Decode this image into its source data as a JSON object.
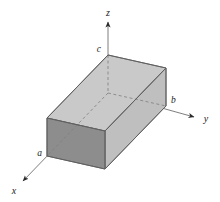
{
  "figure": {
    "kind": "3d-rectangular-box-diagram",
    "background_color": "#ffffff",
    "canvas": {
      "width": 220,
      "height": 202
    }
  },
  "axes": {
    "line_color": "#5a5a5a",
    "arrow_color": "#2b2b2b",
    "origin": {
      "x": 108,
      "y": 93
    },
    "items": [
      {
        "name": "z-axis",
        "label": "z",
        "label_x": 108,
        "label_y": 16,
        "line": {
          "x1": 108,
          "y1": 93,
          "x2": 108,
          "y2": 22
        },
        "arrow_at": {
          "x": 108,
          "y": 22
        },
        "direction": "up"
      },
      {
        "name": "y-axis",
        "label": "y",
        "label_x": 206,
        "label_y": 122,
        "line": {
          "x1": 108,
          "y1": 93,
          "x2": 194,
          "y2": 117
        },
        "arrow_at": {
          "x": 194,
          "y": 117
        },
        "direction": "right-down"
      },
      {
        "name": "x-axis",
        "label": "x",
        "label_x": 14,
        "label_y": 194,
        "line": {
          "x1": 108,
          "y1": 93,
          "x2": 23,
          "y2": 181
        },
        "arrow_at": {
          "x": 23,
          "y": 181
        },
        "direction": "left-down"
      }
    ]
  },
  "box": {
    "name": "rectangular-parallelepiped",
    "edge_color": "#6b6b6b",
    "hidden_edge_color": "#7d7d7d",
    "hidden_edge_dash": "3,2.5",
    "faces": {
      "top": {
        "fill": "#c9c9c9",
        "label": "top-face"
      },
      "front_left": {
        "fill": "#8d8d8d",
        "label": "front-left-face"
      },
      "front_right": {
        "fill": "#bfbfbf",
        "label": "front-right-face"
      }
    },
    "vertices": {
      "origin": {
        "x": 108,
        "y": 93
      },
      "x_base": {
        "x": 47,
        "y": 156
      },
      "y_base": {
        "x": 166,
        "y": 106
      },
      "xy_base": {
        "x": 105,
        "y": 169
      },
      "z_top": {
        "x": 108,
        "y": 55
      },
      "xz_top": {
        "x": 47,
        "y": 118
      },
      "yz_top": {
        "x": 166,
        "y": 68
      },
      "xyz_top": {
        "x": 105,
        "y": 131
      }
    }
  },
  "vertex_labels": [
    {
      "name": "vertex-label-a",
      "text": "a",
      "x": 42,
      "y": 156,
      "anchor": "end",
      "axis": "x"
    },
    {
      "name": "vertex-label-b",
      "text": "b",
      "x": 171,
      "y": 103,
      "anchor": "start",
      "axis": "y"
    },
    {
      "name": "vertex-label-c",
      "text": "c",
      "x": 101,
      "y": 52,
      "anchor": "end",
      "axis": "z"
    }
  ]
}
